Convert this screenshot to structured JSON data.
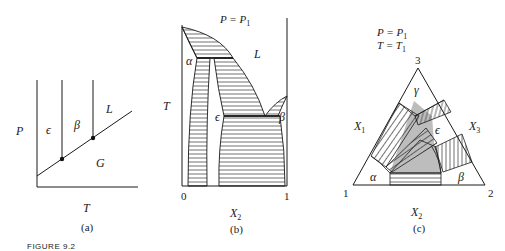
{
  "figure": {
    "caption": "FIGURE 9.2",
    "panels": [
      {
        "id": "a",
        "label": "(a)",
        "x_axis_label": "T",
        "y_axis_label": "P",
        "regions": [
          "ε",
          "β",
          "L",
          "G"
        ],
        "triple_points": 2
      },
      {
        "id": "b",
        "label": "(b)",
        "condition": "P = P1",
        "x_axis_label": "X2",
        "y_axis_label": "T",
        "x_ticks": [
          "0",
          "1"
        ],
        "regions": [
          "α",
          "L",
          "ε",
          "β"
        ]
      },
      {
        "id": "c",
        "label": "(c)",
        "condition_1": "P = P1",
        "condition_2": "T = T1",
        "vertices": [
          "1",
          "2",
          "3"
        ],
        "edge_labels": [
          "X1",
          "X2",
          "X3"
        ],
        "regions": [
          "α",
          "β",
          "γ",
          "ε"
        ]
      }
    ]
  },
  "text": {
    "a_eps": "ϵ",
    "a_beta": "β",
    "a_L": "L",
    "a_G": "G",
    "a_P": "P",
    "a_T": "T",
    "a_label": "(a)",
    "b_cond": "P = P",
    "b_cond_sub": "1",
    "b_L": "L",
    "b_alpha": "α",
    "b_eps": "ϵ",
    "b_beta": "β",
    "b_T": "T",
    "b_x0": "0",
    "b_x1": "1",
    "b_X": "X",
    "b_X_sub": "2",
    "b_label": "(b)",
    "c_cond1": "P = P",
    "c_cond1_sub": "1",
    "c_cond2": "T = T",
    "c_cond2_sub": "1",
    "c_v3": "3",
    "c_v1": "1",
    "c_v2": "2",
    "c_gamma": "γ",
    "c_eps": "ϵ",
    "c_alpha": "α",
    "c_beta": "β",
    "c_X1": "X",
    "c_X1_sub": "1",
    "c_X3": "X",
    "c_X3_sub": "3",
    "c_X2": "X",
    "c_X2_sub": "2",
    "c_label": "(c)",
    "caption": "FIGURE 9.2"
  },
  "colors": {
    "ink": "#1a1a1a",
    "shade": "#bdbdbd",
    "background": "#ffffff"
  }
}
